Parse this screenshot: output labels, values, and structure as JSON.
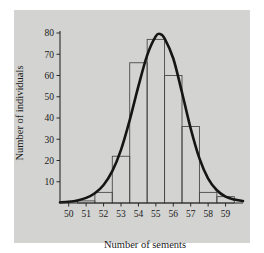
{
  "chart_data": {
    "type": "bar",
    "title": "",
    "subtitle": "",
    "xlabel": "Number of sements",
    "ylabel": "Number of individuals",
    "categories": [
      "50",
      "51",
      "52",
      "53",
      "54",
      "55",
      "56",
      "57",
      "58",
      "59"
    ],
    "values": [
      0,
      1,
      5,
      22,
      66,
      77,
      60,
      36,
      5,
      3
    ],
    "series": [
      {
        "name": "Histogram of individuals",
        "values": [
          0,
          1,
          5,
          22,
          66,
          77,
          60,
          36,
          5,
          3
        ]
      },
      {
        "name": "Fitted normal curve",
        "type": "line",
        "x": [
          49.5,
          50.0,
          50.5,
          51.0,
          51.5,
          52.0,
          52.5,
          53.0,
          53.5,
          54.0,
          54.5,
          55.0,
          55.25,
          55.5,
          56.0,
          56.5,
          57.0,
          57.5,
          58.0,
          58.5,
          59.0,
          59.5,
          60.0
        ],
        "values": [
          0.3,
          0.6,
          1.2,
          2.4,
          4.6,
          8.5,
          15.0,
          25.0,
          39.0,
          55.0,
          69.5,
          78.5,
          79.5,
          77.5,
          68.0,
          52.0,
          35.0,
          21.0,
          11.5,
          6.0,
          3.0,
          1.6,
          0.9
        ]
      }
    ],
    "xlim": [
      49.5,
      60.0
    ],
    "ylim": [
      0,
      85
    ],
    "x_ticks": [
      50,
      51,
      52,
      53,
      54,
      55,
      56,
      57,
      58,
      59
    ],
    "y_ticks": [
      10,
      20,
      30,
      40,
      50,
      60,
      70,
      80
    ],
    "x_tick_labels": [
      "50",
      "51",
      "52",
      "53",
      "54",
      "55",
      "56",
      "57",
      "58",
      "59"
    ],
    "y_tick_labels": [
      "10",
      "20",
      "30",
      "40",
      "50",
      "60",
      "70",
      "80"
    ],
    "grid": false,
    "legend": "none",
    "bar_edge_color": "#4a4a4a",
    "bar_fill_color": "none",
    "curve_color": "#151515",
    "panel_color": "#d3d3d1",
    "axis_color": "#2b2b2b",
    "bin_width": 1
  },
  "figure": {
    "background_color": "#ffffff"
  }
}
